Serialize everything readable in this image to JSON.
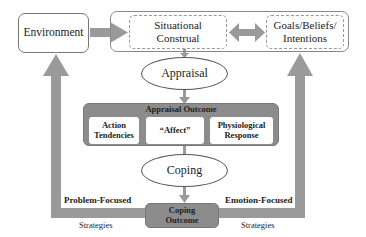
{
  "diagram": {
    "nodes": {
      "environment": "Environment",
      "situational_construal": "Situational Construal",
      "goals_beliefs_intentions": "Goals/Beliefs/ Intentions",
      "appraisal": "Appraisal",
      "appraisal_outcome": {
        "title": "Appraisal Outcome",
        "items": [
          "Action Tendencies",
          "“Affect”",
          "Physiological Response"
        ]
      },
      "coping": "Coping",
      "coping_outcome": "Coping Outcome"
    },
    "edge_labels": {
      "problem_focused": "Problem-Focused",
      "problem_strategies": "Strategies",
      "emotion_focused": "Emotion-Focused",
      "emotion_strategies": "Strategies"
    },
    "colors": {
      "arrow": "#9a9a9a",
      "outcome_fill": "#8c8c8c",
      "border": "#777777"
    }
  }
}
